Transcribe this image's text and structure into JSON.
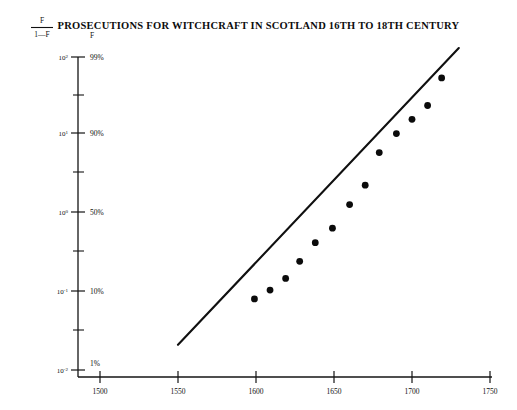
{
  "figure": {
    "title": "PROSECUTIONS FOR WITCHCRAFT IN SCOTLAND 16TH TO 18TH CENTURY",
    "background_color": "#ffffff",
    "ink_color": "#101010"
  },
  "axes": {
    "y_left_header_numerator": "F",
    "y_left_header_denominator": "1—F",
    "y_right_header": "F",
    "y_left_ticks": [
      {
        "mantissa": "10",
        "exponent": "2",
        "value": 100
      },
      {
        "mantissa": "10",
        "exponent": "1",
        "value": 10
      },
      {
        "mantissa": "10",
        "exponent": "0",
        "value": 1
      },
      {
        "mantissa": "10",
        "exponent": "-1",
        "value": 0.1
      },
      {
        "mantissa": "10",
        "exponent": "-2",
        "value": 0.01
      }
    ],
    "y_right_ticks": [
      "99%",
      "90%",
      "50%",
      "10%",
      "1%"
    ],
    "x_ticks": [
      "1500",
      "1550",
      "1600",
      "1650",
      "1700",
      "1750"
    ]
  },
  "chart_data": {
    "type": "scatter",
    "title": "PROSECUTIONS FOR WITCHCRAFT IN SCOTLAND 16TH TO 18TH CENTURY",
    "xlabel": "",
    "ylabel": "F / (1 - F)",
    "y_scale": "logit",
    "xlim": [
      1460,
      1750
    ],
    "ylim": [
      0.01,
      100
    ],
    "grid": false,
    "legend": null,
    "x_tick_values": [
      1500,
      1550,
      1600,
      1650,
      1700,
      1750
    ],
    "y_tick_values": [
      100,
      10,
      1,
      0.1,
      0.01
    ],
    "y_tick_percent_labels": [
      "99%",
      "90%",
      "50%",
      "10%",
      "1%"
    ],
    "points": [
      {
        "x": 1599,
        "y": 0.081,
        "f_percent": 7.5
      },
      {
        "x": 1609,
        "y": 0.105,
        "f_percent": 9.5
      },
      {
        "x": 1619,
        "y": 0.148,
        "f_percent": 12.9
      },
      {
        "x": 1628,
        "y": 0.245,
        "f_percent": 19.7
      },
      {
        "x": 1638,
        "y": 0.424,
        "f_percent": 29.8
      },
      {
        "x": 1649,
        "y": 0.65,
        "f_percent": 39.4
      },
      {
        "x": 1660,
        "y": 1.3,
        "f_percent": 56.5
      },
      {
        "x": 1670,
        "y": 2.3,
        "f_percent": 69.7
      },
      {
        "x": 1679,
        "y": 6.0,
        "f_percent": 85.7
      },
      {
        "x": 1690,
        "y": 10.5,
        "f_percent": 91.3
      },
      {
        "x": 1700,
        "y": 16.0,
        "f_percent": 94.1
      },
      {
        "x": 1710,
        "y": 24.0,
        "f_percent": 96.0
      },
      {
        "x": 1719,
        "y": 54.0,
        "f_percent": 98.2
      }
    ],
    "fit_line": {
      "x_start": 1550,
      "y_start": 0.021,
      "x_end": 1730,
      "y_end": 130.0,
      "style": "solid"
    }
  }
}
